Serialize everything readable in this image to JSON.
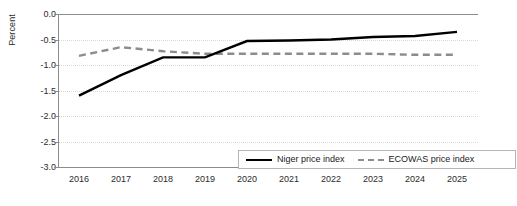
{
  "chart_data": {
    "type": "line",
    "title": "",
    "xlabel": "",
    "ylabel": "Percent",
    "categories": [
      "2016",
      "2017",
      "2018",
      "2019",
      "2020",
      "2021",
      "2022",
      "2023",
      "2024",
      "2025"
    ],
    "ylim": [
      -3.0,
      0.0
    ],
    "yticks": [
      "0.0",
      "-0.5",
      "-1.0",
      "-1.5",
      "-2.0",
      "-2.5",
      "-3.0"
    ],
    "ytick_values": [
      0.0,
      -0.5,
      -1.0,
      -1.5,
      -2.0,
      -2.5,
      -3.0
    ],
    "grid": true,
    "legend_position": "bottom-right",
    "series": [
      {
        "name": "Niger price index",
        "style": "solid",
        "color": "#000000",
        "values": [
          -1.6,
          -1.2,
          -0.85,
          -0.85,
          -0.53,
          -0.52,
          -0.5,
          -0.45,
          -0.43,
          -0.35
        ]
      },
      {
        "name": "ECOWAS price index",
        "style": "dashed",
        "color": "#8c8c8c",
        "values": [
          -0.82,
          -0.65,
          -0.73,
          -0.78,
          -0.78,
          -0.78,
          -0.78,
          -0.78,
          -0.8,
          -0.8
        ]
      }
    ]
  },
  "axis": {
    "y_title": "Percent"
  },
  "legend": {
    "items": [
      {
        "label": "Niger price index"
      },
      {
        "label": "ECOWAS price index"
      }
    ]
  }
}
